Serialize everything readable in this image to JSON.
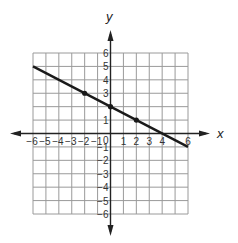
{
  "chart_data": {
    "type": "line",
    "title": "",
    "xlabel": "x",
    "ylabel": "y",
    "xlim": [
      -6,
      6
    ],
    "ylim": [
      -6,
      6
    ],
    "grid": true,
    "x_ticks": [
      -6,
      -5,
      -4,
      -3,
      -2,
      -1,
      0,
      1,
      2,
      3,
      4,
      6
    ],
    "y_ticks": [
      6,
      5,
      4,
      3,
      1,
      -1,
      -2,
      -3,
      -4,
      -5,
      -6
    ],
    "origin_label": "0",
    "series": [
      {
        "name": "line",
        "equation": "y = -1/2 x + 2",
        "x": [
          -6,
          6
        ],
        "values": [
          5,
          -1
        ]
      }
    ],
    "marked_points": [
      {
        "x": -2,
        "y": 3
      },
      {
        "x": 0,
        "y": 2
      },
      {
        "x": 2,
        "y": 1
      }
    ]
  },
  "colors": {
    "grid": "#9a9a9a",
    "axis": "#222222",
    "line": "#1a1a1a"
  }
}
